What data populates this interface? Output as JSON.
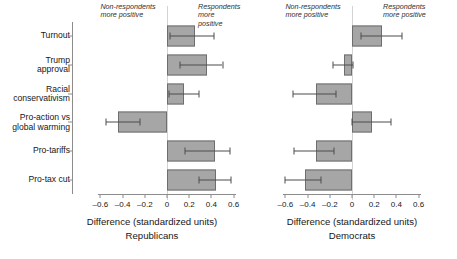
{
  "chart_data": {
    "type": "bar",
    "orientation": "horizontal",
    "title": "",
    "categories": [
      "Turnout",
      "Trump\napproval",
      "Racial\nconservativism",
      "Pro-action vs\nglobal warming",
      "Pro-tariffs",
      "Pro-tax cut"
    ],
    "xlabel": "Difference (standardized units)",
    "ylabel": "",
    "xlim": [
      -0.7,
      0.68
    ],
    "xticks": [
      -0.6,
      -0.4,
      -0.2,
      0,
      0.2,
      0.4,
      0.6
    ],
    "xticklabels": [
      "–0.6",
      "–0.4",
      "–0.2",
      "0",
      "0.2",
      "0.4",
      "0.6"
    ],
    "grid": false,
    "legend": null,
    "reference_line": 0,
    "annotations": {
      "left": "Non-respondents\nmore positive",
      "right": "Respondents\nmore positive"
    },
    "panels": [
      {
        "name": "Republicans",
        "xlabel": "Difference (standardized units)",
        "xticks": [
          -0.6,
          -0.4,
          -0.2,
          0,
          0.2,
          0.4,
          0.6
        ],
        "xticklabels": [
          "–0.6",
          "–0.4",
          "–0.2",
          "0",
          "0.2",
          "0.4",
          "0.6"
        ],
        "bars": [
          {
            "category": "Turnout",
            "value": 0.25,
            "ci_low": 0.03,
            "ci_high": 0.42
          },
          {
            "category": "Trump approval",
            "value": 0.36,
            "ci_low": 0.12,
            "ci_high": 0.5
          },
          {
            "category": "Racial conservativism",
            "value": 0.15,
            "ci_low": 0.02,
            "ci_high": 0.29
          },
          {
            "category": "Pro-action vs global warming",
            "value": -0.44,
            "ci_low": -0.55,
            "ci_high": -0.24
          },
          {
            "category": "Pro-tariffs",
            "value": 0.43,
            "ci_low": 0.16,
            "ci_high": 0.57
          },
          {
            "category": "Pro-tax cut",
            "value": 0.44,
            "ci_low": 0.29,
            "ci_high": 0.58
          }
        ]
      },
      {
        "name": "Democrats",
        "xlabel": "Difference (standardized units)",
        "xticks": [
          -0.6,
          -0.4,
          -0.2,
          0,
          0.2,
          0.4,
          0.6
        ],
        "xticklabels": [
          "–0.6",
          "–0.4",
          "–0.2",
          "0",
          "0.2",
          "0.4",
          "0.6"
        ],
        "bars": [
          {
            "category": "Turnout",
            "value": 0.27,
            "ci_low": 0.08,
            "ci_high": 0.45
          },
          {
            "category": "Trump approval",
            "value": -0.07,
            "ci_low": -0.17,
            "ci_high": 0.01
          },
          {
            "category": "Racial conservativism",
            "value": -0.32,
            "ci_low": -0.53,
            "ci_high": -0.14
          },
          {
            "category": "Pro-action vs global warming",
            "value": 0.18,
            "ci_low": 0.0,
            "ci_high": 0.35
          },
          {
            "category": "Pro-tariffs",
            "value": -0.32,
            "ci_low": -0.52,
            "ci_high": -0.16
          },
          {
            "category": "Pro-tax cut",
            "value": -0.42,
            "ci_low": -0.6,
            "ci_high": -0.28
          }
        ]
      }
    ]
  },
  "colors": {
    "bar_fill": "#a6a6a6",
    "bar_edge": "#6e6e6e",
    "error_bar": "#4d4d4d",
    "axis": "#8c8c8c",
    "zero_line": "#d2d2d2",
    "text": "#171717",
    "background": "#ffffff"
  }
}
